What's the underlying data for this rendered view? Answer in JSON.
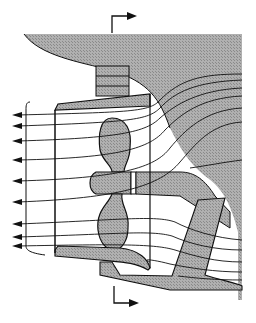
{
  "diagram": {
    "type": "technical-cross-section",
    "colors": {
      "hull_fill": "#a9a9a9",
      "hatch": "#8c8c8c",
      "line": "#111111",
      "background": "#ffffff"
    },
    "section_markers": [
      {
        "position": "top",
        "direction": "right"
      },
      {
        "position": "bottom",
        "direction": "right"
      }
    ],
    "outflow_arrow_count": 10,
    "streamline_count": 12
  }
}
